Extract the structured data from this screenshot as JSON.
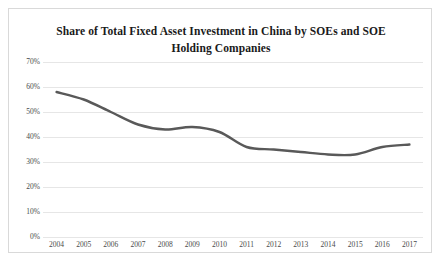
{
  "chart_data": {
    "type": "line",
    "title": "Share of Total Fixed Asset Investment in China by SOEs and SOE Holding Companies",
    "xlabel": "",
    "ylabel": "",
    "categories": [
      "2004",
      "2005",
      "2006",
      "2007",
      "2008",
      "2009",
      "2010",
      "2011",
      "2012",
      "2013",
      "2014",
      "2015",
      "2016",
      "2017"
    ],
    "values": [
      58,
      55,
      50,
      45,
      43,
      44,
      42,
      36,
      35,
      34,
      33,
      33,
      36,
      37
    ],
    "ylim": [
      0,
      70
    ],
    "ytick_labels": [
      "70%",
      "60%",
      "50%",
      "40%",
      "30%",
      "20%",
      "10%",
      "0%"
    ],
    "ytick_values": [
      70,
      60,
      50,
      40,
      30,
      20,
      10,
      0
    ],
    "grid": true,
    "legend": "none",
    "series": [
      {
        "name": "SOE share of total fixed asset investment",
        "color": "#595959",
        "values": [
          58,
          55,
          50,
          45,
          43,
          44,
          42,
          36,
          35,
          34,
          33,
          33,
          36,
          37
        ]
      }
    ],
    "colors": {
      "line": "#595959",
      "grid": "#e6e6e6",
      "border": "#d9d9d9",
      "title_text": "#1a1a1a",
      "tick_text": "#4a4a4a",
      "background": "#ffffff"
    }
  }
}
